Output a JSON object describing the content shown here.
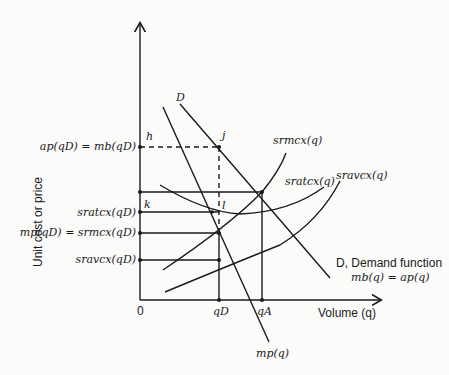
{
  "axes": {
    "y_label": "Unit cost or price",
    "x_label": "Volume (q)",
    "origin": "0"
  },
  "y_ticks": {
    "ap_mb": "ap(qD) = mb(qD)",
    "sratc": "sratcx(qD)",
    "mp_srmc": "mp(qD) = srmcx(qD)",
    "sravc": "sravcx(qD)"
  },
  "x_ticks": {
    "qD": "qD",
    "qA": "qA"
  },
  "points": {
    "h": "h",
    "j": "j",
    "k": "k",
    "l": "l"
  },
  "curves": {
    "D_top": "D",
    "srmc": "srmcx(q)",
    "sratc": "sratcx(q)",
    "sravc": "sravcx(q)",
    "demand_line1": "D, Demand function",
    "demand_line2": "mb(q) = ap(q)",
    "mp": "mp(q)"
  },
  "colors": {
    "ink": "#1a1a1a",
    "background": "#fbfbf9"
  }
}
